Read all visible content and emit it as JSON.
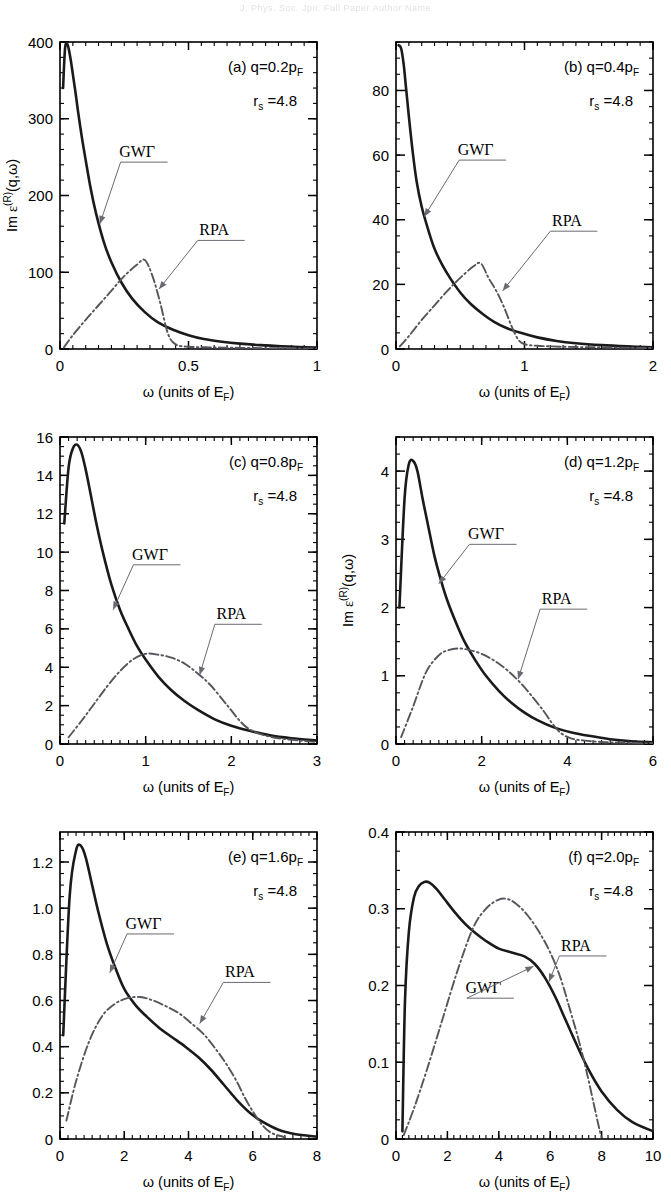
{
  "figure": {
    "header_ghost": "J. Phys. Soc. Jpn.    Full Paper    Author Name",
    "axis_label_x": "ω  (units of E",
    "axis_label_x_sub": "F",
    "axis_label_x_tail": ")",
    "axis_label_y_pre": "Im ",
    "axis_label_y_eps": "ε",
    "axis_label_y_sup": "(R)",
    "axis_label_y_post": "(q,ω)",
    "legend_gw": "GWΓ",
    "legend_rpa": "RPA",
    "rs_label_pre": "r",
    "rs_label_sub": "s",
    "rs_label_post": " =4.8",
    "colors": {
      "gw": "#1a1a1a",
      "rpa": "#55555c",
      "axis": "#000000",
      "leader": "#6a6a72"
    }
  },
  "chart_data": [
    {
      "type": "line",
      "panel": "a",
      "tag": "(a)",
      "q_pre": "q=0.2p",
      "q_sub": "F",
      "rs": "4.8",
      "xlabel": "ω  (units of E_F)",
      "ylabel": "Im ε^(R)(q,ω)",
      "xlim": [
        0,
        1
      ],
      "ylim": [
        0,
        400
      ],
      "xticks": [
        0,
        0.5,
        1
      ],
      "xticklabels": [
        "0",
        "0.5",
        "1"
      ],
      "xminor": 0.05,
      "yticks": [
        0,
        100,
        200,
        300,
        400
      ],
      "yticklabels": [
        "0",
        "100",
        "200",
        "300",
        "400"
      ],
      "yminor": 20,
      "ylabel_show": true,
      "series": [
        {
          "name": "GWΓ",
          "style": "gw",
          "x": [
            0.012,
            0.02,
            0.03,
            0.04,
            0.05,
            0.06,
            0.07,
            0.085,
            0.1,
            0.12,
            0.14,
            0.17,
            0.2,
            0.24,
            0.28,
            0.33,
            0.38,
            0.44,
            0.5,
            0.56,
            0.63,
            0.7,
            0.78,
            0.86,
            0.93,
            1.0
          ],
          "y": [
            340,
            393,
            396,
            380,
            358,
            335,
            310,
            276,
            246,
            208,
            177,
            140,
            113,
            86,
            66,
            48,
            35,
            25,
            18,
            13,
            9.5,
            7,
            5,
            3.5,
            2.6,
            2
          ]
        },
        {
          "name": "RPA",
          "style": "rpa",
          "x": [
            0.015,
            0.05,
            0.1,
            0.15,
            0.2,
            0.25,
            0.3,
            0.33,
            0.36,
            0.39,
            0.42,
            0.45,
            0.5,
            0.6,
            0.7,
            0.85,
            1.0
          ],
          "y": [
            2,
            18,
            38,
            57,
            76,
            95,
            110,
            116,
            95,
            60,
            20,
            6,
            3,
            2,
            1.5,
            1,
            0.8
          ]
        }
      ],
      "annotations": [
        {
          "text": "GWΓ",
          "tx": 0.3,
          "ty": 250,
          "ax": 0.155,
          "ay": 163
        },
        {
          "text": "RPA",
          "tx": 0.6,
          "ty": 148,
          "ax": 0.385,
          "ay": 78
        }
      ]
    },
    {
      "type": "line",
      "panel": "b",
      "tag": "(b)",
      "q_pre": "q=0.4p",
      "q_sub": "F",
      "rs": "4.8",
      "xlabel": "ω  (units of E_F)",
      "ylabel": "",
      "xlim": [
        0,
        2
      ],
      "ylim": [
        0,
        95
      ],
      "xticks": [
        0,
        1,
        2
      ],
      "xticklabels": [
        "0",
        "1",
        "2"
      ],
      "xminor": 0.1,
      "yticks": [
        0,
        20,
        40,
        60,
        80
      ],
      "yticklabels": [
        "0",
        "20",
        "40",
        "60",
        "80"
      ],
      "yminor": 5,
      "ylabel_show": false,
      "series": [
        {
          "name": "GWΓ",
          "style": "gw",
          "x": [
            0.02,
            0.04,
            0.06,
            0.08,
            0.1,
            0.13,
            0.16,
            0.2,
            0.25,
            0.3,
            0.36,
            0.42,
            0.5,
            0.58,
            0.67,
            0.76,
            0.86,
            0.97,
            1.1,
            1.25,
            1.4,
            1.6,
            1.8,
            2.0
          ],
          "y": [
            94,
            93,
            88,
            80,
            72,
            61,
            52,
            44,
            37,
            31,
            26,
            22,
            17.5,
            14,
            11,
            8.5,
            6.5,
            5,
            3.6,
            2.5,
            1.8,
            1.2,
            0.8,
            0.5
          ]
        },
        {
          "name": "RPA",
          "style": "rpa",
          "x": [
            0.03,
            0.1,
            0.2,
            0.3,
            0.4,
            0.5,
            0.6,
            0.66,
            0.72,
            0.78,
            0.84,
            0.9,
            0.95,
            1.0,
            1.1,
            1.3,
            1.6,
            2.0
          ],
          "y": [
            0.8,
            4,
            9,
            13.5,
            18,
            22,
            25.5,
            26.5,
            22,
            18,
            13,
            7,
            3,
            1.5,
            1,
            0.7,
            0.5,
            0.3
          ]
        }
      ],
      "annotations": [
        {
          "text": "GWΓ",
          "tx": 0.62,
          "ty": 60,
          "ax": 0.22,
          "ay": 41
        },
        {
          "text": "RPA",
          "tx": 1.33,
          "ty": 38,
          "ax": 0.83,
          "ay": 18
        }
      ]
    },
    {
      "type": "line",
      "panel": "c",
      "tag": "(c)",
      "q_pre": "q=0.8p",
      "q_sub": "F",
      "rs": "4.8",
      "xlabel": "ω  (units of E_F)",
      "ylabel": "",
      "xlim": [
        0,
        3
      ],
      "ylim": [
        0,
        16
      ],
      "xticks": [
        0,
        1,
        2,
        3
      ],
      "xticklabels": [
        "0",
        "1",
        "2",
        "3"
      ],
      "xminor": 0.1,
      "yticks": [
        0,
        2,
        4,
        6,
        8,
        10,
        12,
        14,
        16
      ],
      "yticklabels": [
        "0",
        "2",
        "4",
        "6",
        "8",
        "10",
        "12",
        "14",
        "16"
      ],
      "yminor": 0.5,
      "ylabel_show": false,
      "series": [
        {
          "name": "GWΓ",
          "style": "gw",
          "x": [
            0.05,
            0.1,
            0.15,
            0.2,
            0.25,
            0.3,
            0.35,
            0.42,
            0.5,
            0.6,
            0.7,
            0.8,
            0.9,
            1.0,
            1.15,
            1.3,
            1.45,
            1.6,
            1.8,
            2.0,
            2.2,
            2.45,
            2.7,
            3.0
          ],
          "y": [
            11.5,
            14.4,
            15.4,
            15.6,
            15.2,
            14.3,
            13.2,
            11.6,
            10.0,
            8.3,
            7.0,
            6.0,
            5.1,
            4.4,
            3.5,
            2.8,
            2.25,
            1.8,
            1.3,
            0.95,
            0.7,
            0.45,
            0.3,
            0.18
          ]
        },
        {
          "name": "RPA",
          "style": "rpa",
          "x": [
            0.1,
            0.25,
            0.4,
            0.55,
            0.7,
            0.85,
            1.0,
            1.15,
            1.3,
            1.45,
            1.6,
            1.75,
            1.9,
            2.0,
            2.1,
            2.2,
            2.35,
            2.55,
            2.8,
            3.0
          ],
          "y": [
            0.35,
            1.2,
            2.1,
            3.0,
            3.8,
            4.4,
            4.7,
            4.65,
            4.5,
            4.2,
            3.7,
            3.1,
            2.3,
            1.75,
            1.2,
            0.8,
            0.5,
            0.3,
            0.18,
            0.1
          ]
        }
      ],
      "annotations": [
        {
          "text": "GWΓ",
          "tx": 1.05,
          "ty": 9.6,
          "ax": 0.62,
          "ay": 7.0
        },
        {
          "text": "RPA",
          "tx": 2.0,
          "ty": 6.5,
          "ax": 1.63,
          "ay": 3.6
        }
      ]
    },
    {
      "type": "line",
      "panel": "d",
      "tag": "(d)",
      "q_pre": "q=1.2p",
      "q_sub": "F",
      "rs": "4.8",
      "xlabel": "ω  (units of E_F)",
      "ylabel": "Im ε^(R)(q,ω)",
      "xlim": [
        0,
        6
      ],
      "ylim": [
        0,
        4.5
      ],
      "xticks": [
        0,
        2,
        4,
        6
      ],
      "xticklabels": [
        "0",
        "2",
        "4",
        "6"
      ],
      "xminor": 0.2,
      "yticks": [
        0,
        1,
        2,
        3,
        4
      ],
      "yticklabels": [
        "0",
        "1",
        "2",
        "3",
        "4"
      ],
      "yminor": 0.25,
      "ylabel_show": true,
      "series": [
        {
          "name": "GWΓ",
          "style": "gw",
          "x": [
            0.08,
            0.2,
            0.3,
            0.4,
            0.5,
            0.62,
            0.75,
            0.9,
            1.05,
            1.2,
            1.4,
            1.6,
            1.85,
            2.1,
            2.4,
            2.7,
            3.0,
            3.3,
            3.7,
            4.1,
            4.5,
            5.0,
            5.5,
            6.0
          ],
          "y": [
            2.0,
            3.6,
            4.1,
            4.15,
            4.0,
            3.6,
            3.2,
            2.75,
            2.4,
            2.1,
            1.78,
            1.5,
            1.23,
            1.0,
            0.78,
            0.6,
            0.46,
            0.35,
            0.24,
            0.17,
            0.12,
            0.07,
            0.04,
            0.025
          ]
        },
        {
          "name": "RPA",
          "style": "rpa",
          "x": [
            0.12,
            0.4,
            0.7,
            1.0,
            1.2,
            1.45,
            1.7,
            2.0,
            2.3,
            2.6,
            2.9,
            3.2,
            3.45,
            3.65,
            3.85,
            4.1,
            4.4,
            4.8,
            5.3,
            6.0
          ],
          "y": [
            0.1,
            0.55,
            1.05,
            1.3,
            1.37,
            1.4,
            1.38,
            1.32,
            1.22,
            1.08,
            0.9,
            0.68,
            0.48,
            0.3,
            0.16,
            0.08,
            0.05,
            0.03,
            0.02,
            0.01
          ]
        }
      ],
      "annotations": [
        {
          "text": "GWΓ",
          "tx": 2.1,
          "ty": 3.0,
          "ax": 1.0,
          "ay": 2.35
        },
        {
          "text": "RPA",
          "tx": 3.75,
          "ty": 2.05,
          "ax": 2.85,
          "ay": 0.95
        }
      ]
    },
    {
      "type": "line",
      "panel": "e",
      "tag": "(e)",
      "q_pre": "q=1.6p",
      "q_sub": "F",
      "rs": "4.8",
      "xlabel": "ω  (units of E_F)",
      "ylabel": "",
      "xlim": [
        0,
        8
      ],
      "ylim": [
        0,
        1.33
      ],
      "xticks": [
        0,
        2,
        4,
        6,
        8
      ],
      "xticklabels": [
        "0",
        "2",
        "4",
        "6",
        "8"
      ],
      "xminor": 0.25,
      "yticks": [
        0,
        0.2,
        0.4,
        0.6,
        0.8,
        1.0,
        1.2
      ],
      "yticklabels": [
        "0",
        "0.2",
        "0.4",
        "0.6",
        "0.8",
        "1.0",
        "1.2"
      ],
      "yminor": 0.05,
      "ylabel_show": false,
      "series": [
        {
          "name": "GWΓ",
          "style": "gw",
          "x": [
            0.1,
            0.3,
            0.5,
            0.65,
            0.8,
            1.0,
            1.2,
            1.45,
            1.7,
            2.0,
            2.35,
            2.7,
            3.1,
            3.5,
            3.9,
            4.3,
            4.7,
            5.1,
            5.5,
            5.9,
            6.3,
            6.8,
            7.3,
            8.0
          ],
          "y": [
            0.45,
            1.05,
            1.25,
            1.27,
            1.22,
            1.1,
            0.98,
            0.85,
            0.75,
            0.65,
            0.58,
            0.53,
            0.48,
            0.44,
            0.4,
            0.355,
            0.3,
            0.235,
            0.17,
            0.115,
            0.075,
            0.04,
            0.022,
            0.01
          ]
        },
        {
          "name": "RPA",
          "style": "rpa",
          "x": [
            0.2,
            0.5,
            0.9,
            1.3,
            1.7,
            2.1,
            2.5,
            2.9,
            3.3,
            3.7,
            4.1,
            4.5,
            4.9,
            5.2,
            5.5,
            5.75,
            6.0,
            6.3,
            6.6,
            7.0
          ],
          "y": [
            0.08,
            0.25,
            0.42,
            0.53,
            0.585,
            0.61,
            0.615,
            0.6,
            0.575,
            0.545,
            0.5,
            0.45,
            0.38,
            0.32,
            0.25,
            0.18,
            0.12,
            0.06,
            0.025,
            0.008
          ]
        }
      ],
      "annotations": [
        {
          "text": "GWΓ",
          "tx": 2.6,
          "ty": 0.91,
          "ax": 1.55,
          "ay": 0.72
        },
        {
          "text": "RPA",
          "tx": 5.6,
          "ty": 0.7,
          "ax": 4.35,
          "ay": 0.5
        }
      ]
    },
    {
      "type": "line",
      "panel": "f",
      "tag": "(f)",
      "q_pre": "q=2.0p",
      "q_sub": "F",
      "rs": "4.8",
      "xlabel": "ω  (units of E_F)",
      "ylabel": "",
      "xlim": [
        0,
        10
      ],
      "ylim": [
        0,
        0.4
      ],
      "xticks": [
        0,
        2,
        4,
        6,
        8,
        10
      ],
      "xticklabels": [
        "0",
        "2",
        "4",
        "6",
        "8",
        "10"
      ],
      "xminor": 0.25,
      "yticks": [
        0,
        0.1,
        0.2,
        0.3,
        0.4
      ],
      "yticklabels": [
        "0",
        "0.1",
        "0.2",
        "0.3",
        "0.4"
      ],
      "yminor": 0.025,
      "ylabel_show": false,
      "series": [
        {
          "name": "GWΓ",
          "style": "gw",
          "x": [
            0.25,
            0.35,
            0.5,
            0.7,
            0.9,
            1.1,
            1.3,
            1.6,
            1.9,
            2.3,
            2.7,
            3.1,
            3.5,
            4.0,
            4.5,
            5.0,
            5.4,
            5.8,
            6.2,
            6.6,
            7.0,
            7.5,
            8.0,
            8.6,
            9.2,
            10.0
          ],
          "y": [
            0.01,
            0.18,
            0.27,
            0.315,
            0.33,
            0.335,
            0.334,
            0.325,
            0.312,
            0.295,
            0.28,
            0.268,
            0.258,
            0.248,
            0.243,
            0.238,
            0.228,
            0.21,
            0.185,
            0.155,
            0.125,
            0.09,
            0.062,
            0.038,
            0.022,
            0.01
          ]
        },
        {
          "name": "RPA",
          "style": "rpa",
          "x": [
            0.3,
            0.7,
            1.2,
            1.8,
            2.4,
            3.0,
            3.5,
            4.0,
            4.4,
            4.8,
            5.2,
            5.6,
            6.0,
            6.4,
            6.8,
            7.1,
            7.4,
            7.7,
            7.9,
            8.0
          ],
          "y": [
            0.005,
            0.04,
            0.09,
            0.155,
            0.22,
            0.275,
            0.3,
            0.312,
            0.312,
            0.303,
            0.288,
            0.268,
            0.243,
            0.21,
            0.165,
            0.13,
            0.09,
            0.045,
            0.015,
            0.002
          ]
        }
      ],
      "annotations": [
        {
          "text": "RPA",
          "tx": 7.0,
          "ty": 0.245,
          "ax": 5.95,
          "ay": 0.205
        },
        {
          "text": "GWΓ",
          "tx": 3.4,
          "ty": 0.19,
          "ax": 5.35,
          "ay": 0.225
        }
      ]
    }
  ]
}
